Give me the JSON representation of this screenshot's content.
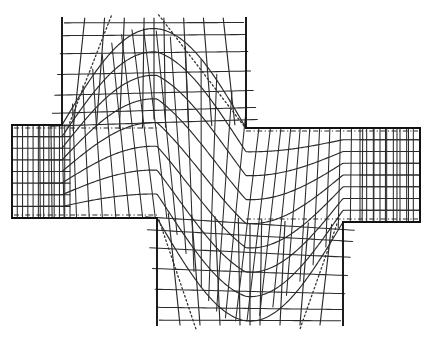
{
  "figure": {
    "kind": "flow-net",
    "background_color": "#ffffff",
    "line_color": "#2b2b2b",
    "wall_color": "#111111",
    "caption": ""
  },
  "chart_data": {
    "type": "line",
    "subtitle": "",
    "xlabel": "",
    "ylabel": "",
    "xlim": [
      0,
      434
    ],
    "ylim": [
      0,
      338
    ],
    "grid": false,
    "legend_position": "none",
    "annotations": [],
    "tick_labels": {
      "x": [],
      "y": []
    },
    "legend": [
      {
        "name": "streamline",
        "style": "solid"
      },
      {
        "name": "equipotential",
        "style": "solid"
      },
      {
        "name": "separatrix",
        "style": "dotted"
      },
      {
        "name": "channel wall",
        "style": "solid-heavy"
      },
      {
        "name": "centerline",
        "style": "dash-dot"
      }
    ],
    "geometry": {
      "left_arm": {
        "x_start": 12,
        "x_end": 157,
        "y_top": 125,
        "y_bottom": 218
      },
      "right_arm": {
        "x_start": 246,
        "x_end": 420,
        "y_top": 128,
        "y_bottom": 222
      },
      "top_arm": {
        "y_start": 18,
        "y_end": 128,
        "x_left": 62,
        "x_right": 246
      },
      "bottom_arm": {
        "y_start": 218,
        "y_end": 325,
        "x_left": 157,
        "x_right": 343
      },
      "stream_bands": 8,
      "equipotential_count": 34
    },
    "series": [
      {
        "name": "streamline-0",
        "psi": 0.0
      },
      {
        "name": "streamline-1",
        "psi": 0.125
      },
      {
        "name": "streamline-2",
        "psi": 0.25
      },
      {
        "name": "streamline-3",
        "psi": 0.375
      },
      {
        "name": "streamline-4",
        "psi": 0.5
      },
      {
        "name": "streamline-5",
        "psi": 0.625
      },
      {
        "name": "streamline-6",
        "psi": 0.75
      },
      {
        "name": "streamline-7",
        "psi": 0.875
      },
      {
        "name": "streamline-8",
        "psi": 1.0
      }
    ]
  }
}
